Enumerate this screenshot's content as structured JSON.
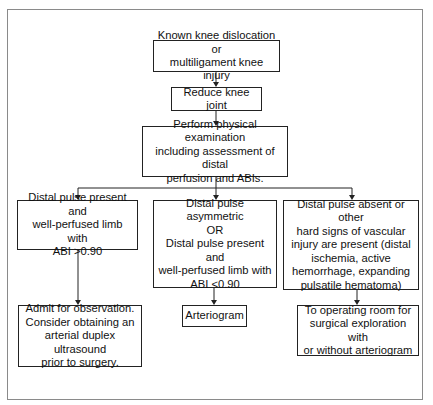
{
  "flowchart": {
    "nodes": {
      "start": {
        "text": "Known knee dislocation or\nmultiligament knee injury"
      },
      "reduce": {
        "text": "Reduce knee joint"
      },
      "exam": {
        "text": "Perform physical examination\nincluding assessment of distal\nperfusion and ABIs."
      },
      "branch_left": {
        "text": "Distal pulse present and\nwell-perfused limb with\nABI >0.90"
      },
      "branch_middle": {
        "text": "Distal pulse asymmetric\nOR\nDistal pulse present and\nwell-perfused limb with\nABI <0.90"
      },
      "branch_right": {
        "text": "Distal pulse absent or other\nhard signs of vascular\ninjury are present (distal\nischemia, active\nhemorrhage, expanding\npulsatile hematoma)"
      },
      "outcome_left": {
        "text": "Admit for observation.\nConsider obtaining an\narterial duplex ultrasound\nprior to surgery."
      },
      "outcome_middle": {
        "text": "Arteriogram"
      },
      "outcome_right": {
        "text": "To operating room for\nsurgical exploration with\nor without arteriogram"
      }
    },
    "edges": [
      [
        "start",
        "reduce"
      ],
      [
        "reduce",
        "exam"
      ],
      [
        "exam",
        "branch_left"
      ],
      [
        "exam",
        "branch_middle"
      ],
      [
        "exam",
        "branch_right"
      ],
      [
        "branch_left",
        "outcome_left"
      ],
      [
        "branch_middle",
        "outcome_middle"
      ],
      [
        "branch_right",
        "outcome_right"
      ]
    ]
  }
}
